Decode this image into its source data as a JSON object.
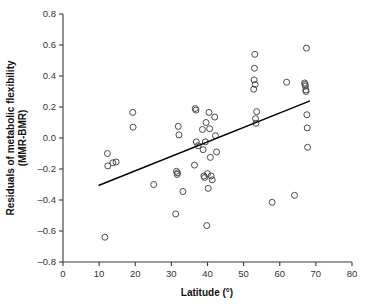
{
  "chart_data": {
    "type": "scatter",
    "title": "",
    "xlabel": "Latitude (°)",
    "ylabel": "Residuals of metabolic flexibility (MMR-BMR)",
    "ylabel_line1": "Residuals of metabolic flexibility",
    "ylabel_line2": "(MMR-BMR)",
    "xlim": [
      0,
      80
    ],
    "ylim": [
      -0.8,
      0.8
    ],
    "xticks": [
      0,
      10,
      20,
      30,
      40,
      50,
      60,
      70,
      80
    ],
    "yticks": [
      -0.8,
      -0.6,
      -0.4,
      -0.2,
      0.0,
      0.2,
      0.4,
      0.6,
      0.8
    ],
    "xtick_labels": [
      "0",
      "10",
      "20",
      "30",
      "40",
      "50",
      "60",
      "70",
      "80"
    ],
    "ytick_labels": [
      "-0.8",
      "-0.6",
      "-0.4",
      "-0.2",
      "0.0",
      "0.2",
      "0.4",
      "0.6",
      "0.8"
    ],
    "grid": false,
    "legend": false,
    "marker": "open-circle",
    "marker_color": "#4a4a4a",
    "marker_radius_px": 3.0,
    "points": [
      [
        11.6,
        -0.64
      ],
      [
        12.3,
        -0.1
      ],
      [
        12.4,
        -0.18
      ],
      [
        13.8,
        -0.16
      ],
      [
        14.7,
        -0.155
      ],
      [
        19.3,
        0.165
      ],
      [
        19.4,
        0.07
      ],
      [
        25.1,
        -0.3
      ],
      [
        31.2,
        -0.49
      ],
      [
        31.4,
        -0.215
      ],
      [
        31.6,
        -0.235
      ],
      [
        31.7,
        -0.225
      ],
      [
        31.9,
        0.075
      ],
      [
        32.1,
        0.02
      ],
      [
        33.2,
        -0.345
      ],
      [
        36.4,
        -0.175
      ],
      [
        36.6,
        0.19
      ],
      [
        36.8,
        0.18
      ],
      [
        36.9,
        -0.025
      ],
      [
        37.4,
        -0.05
      ],
      [
        38.6,
        0.055
      ],
      [
        38.8,
        -0.075
      ],
      [
        39.0,
        -0.245
      ],
      [
        39.2,
        -0.255
      ],
      [
        39.4,
        -0.025
      ],
      [
        39.6,
        0.1
      ],
      [
        39.8,
        -0.565
      ],
      [
        40.0,
        -0.23
      ],
      [
        40.2,
        -0.325
      ],
      [
        40.4,
        0.165
      ],
      [
        40.6,
        0.06
      ],
      [
        40.8,
        -0.125
      ],
      [
        41.0,
        -0.245
      ],
      [
        41.3,
        -0.27
      ],
      [
        42.0,
        0.135
      ],
      [
        42.2,
        0.015
      ],
      [
        42.5,
        -0.09
      ],
      [
        52.8,
        0.315
      ],
      [
        52.9,
        0.375
      ],
      [
        53.0,
        0.45
      ],
      [
        53.1,
        0.54
      ],
      [
        53.2,
        0.345
      ],
      [
        53.3,
        0.125
      ],
      [
        53.4,
        0.095
      ],
      [
        53.6,
        0.17
      ],
      [
        57.9,
        -0.415
      ],
      [
        61.9,
        0.36
      ],
      [
        64.1,
        -0.37
      ],
      [
        66.9,
        0.355
      ],
      [
        67.0,
        0.345
      ],
      [
        67.1,
        0.335
      ],
      [
        67.2,
        0.31
      ],
      [
        67.3,
        0.3
      ],
      [
        67.4,
        0.58
      ],
      [
        67.5,
        0.15
      ],
      [
        67.6,
        0.065
      ],
      [
        67.7,
        -0.06
      ]
    ],
    "trendline": {
      "label": "linear fit",
      "x_start": 10.0,
      "y_start": -0.305,
      "x_end": 68.2,
      "y_end": 0.238,
      "color": "#000000"
    }
  }
}
